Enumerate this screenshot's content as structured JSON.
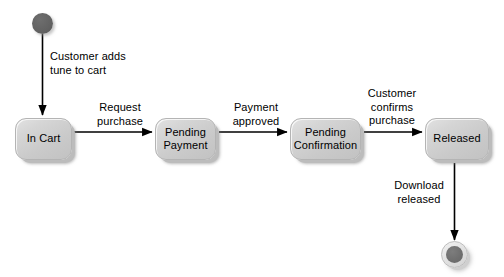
{
  "diagram": {
    "type": "uml-state-machine",
    "colors": {
      "state_fill": "#d0d0d0",
      "state_border": "#b4b4b4",
      "start_node_fill": "#636363",
      "final_node_outer": "#e0e0e0",
      "final_node_inner": "#6f6f6f",
      "edge_stroke": "#000000",
      "text": "#000000",
      "background": "#ffffff"
    },
    "states": [
      {
        "id": "in-cart",
        "label": "In Cart",
        "x": 15,
        "y": 118,
        "width": 57,
        "height": 42
      },
      {
        "id": "pending-payment",
        "label": "Pending\nPayment",
        "x": 155,
        "y": 118,
        "width": 61,
        "height": 42
      },
      {
        "id": "pending-confirmation",
        "label": "Pending\nConfirmation",
        "x": 290,
        "y": 118,
        "width": 71,
        "height": 42
      },
      {
        "id": "released",
        "label": "Released",
        "x": 425,
        "y": 118,
        "width": 64,
        "height": 42
      }
    ],
    "pseudostates": [
      {
        "id": "initial-state",
        "kind": "initial",
        "x": 32,
        "y": 13
      },
      {
        "id": "final-state",
        "kind": "final",
        "x": 441,
        "y": 241
      }
    ],
    "transitions": [
      {
        "id": "start-to-in-cart",
        "from": "initial-state",
        "to": "in-cart",
        "label": "Customer adds\ntune to cart",
        "label_x": 50,
        "label_y": 50,
        "label_align": "left"
      },
      {
        "id": "in-cart-to-pending-payment",
        "from": "in-cart",
        "to": "pending-payment",
        "label": "Request\npurchase",
        "label_x": 89,
        "label_y": 101,
        "label_align": "center"
      },
      {
        "id": "pending-payment-to-pending-confirmation",
        "from": "pending-payment",
        "to": "pending-confirmation",
        "label": "Payment\napproved",
        "label_x": 225,
        "label_y": 101,
        "label_align": "center"
      },
      {
        "id": "pending-confirmation-to-released",
        "from": "pending-confirmation",
        "to": "released",
        "label": "Customer\nconfirms\npurchase",
        "label_x": 363,
        "label_y": 87,
        "label_align": "center"
      },
      {
        "id": "released-to-final",
        "from": "released",
        "to": "final-state",
        "label": "Download\nreleased",
        "label_x": 389,
        "label_y": 179,
        "label_align": "center"
      }
    ]
  }
}
